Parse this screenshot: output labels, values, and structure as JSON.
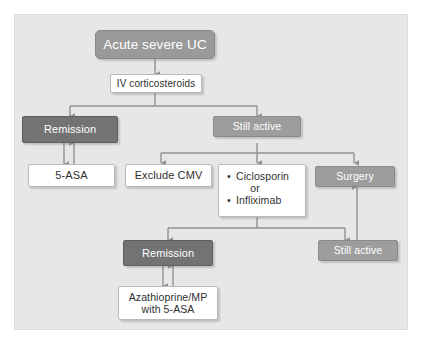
{
  "diagram": {
    "type": "flowchart",
    "background_color": "#e6e7e8",
    "colors": {
      "dark_node": "#737373",
      "mid_node": "#9d9d9d",
      "top_node": "#9a9a9a",
      "white_node": "#ffffff",
      "connector": "#8f9295",
      "text_on_dark": "#ffffff",
      "text_on_white": "#2f2f2f"
    },
    "nodes": {
      "acute_severe_uc": "Acute severe UC",
      "iv_corticosteroids": "IV corticosteroids",
      "remission_top": "Remission",
      "still_active_top": "Still active",
      "five_asa": "5-ASA",
      "exclude_cmv": "Exclude CMV",
      "ciclosporin": "Ciclosporin",
      "or_label": "or",
      "infliximab": "Infliximab",
      "surgery": "Surgery",
      "remission_bottom": "Remission",
      "still_active_bottom": "Still active",
      "azathioprine_line1": "Azathioprine/MP",
      "azathioprine_line2": "with 5-ASA"
    },
    "bullet_glyph": "•"
  }
}
